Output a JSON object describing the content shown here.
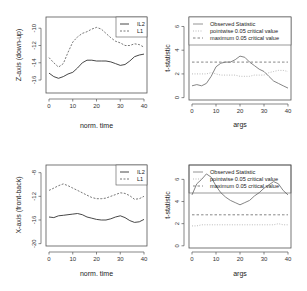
{
  "chart_data": [
    {
      "type": "line",
      "panel": "top-left",
      "xlabel": "norm. time",
      "ylabel": "Z-axis (down-up)",
      "xlim": [
        0,
        40
      ],
      "ylim": [
        -17.5,
        -8.7
      ],
      "xticks": [
        0,
        10,
        20,
        30,
        40
      ],
      "yticks": [
        -16,
        -14,
        -12,
        -10
      ],
      "legend": {
        "position": "topright",
        "entries": [
          "IL2",
          "L1"
        ]
      },
      "x": [
        0,
        2,
        4,
        6,
        8,
        10,
        12,
        14,
        16,
        18,
        20,
        22,
        24,
        26,
        28,
        30,
        32,
        34,
        36,
        38,
        40
      ],
      "series": [
        {
          "name": "IL2",
          "style": "solid",
          "values": [
            -15.2,
            -15.6,
            -15.8,
            -15.6,
            -15.3,
            -15.1,
            -14.6,
            -14.0,
            -13.7,
            -13.7,
            -13.8,
            -13.8,
            -13.8,
            -13.9,
            -14.1,
            -14.3,
            -14.2,
            -13.8,
            -13.3,
            -13.1,
            -13.0
          ]
        },
        {
          "name": "L1",
          "style": "dashed",
          "values": [
            -13.4,
            -14.0,
            -14.5,
            -14.1,
            -12.8,
            -11.6,
            -11.0,
            -10.6,
            -10.4,
            -10.1,
            -9.9,
            -10.1,
            -10.6,
            -11.1,
            -11.5,
            -11.7,
            -12.0,
            -12.0,
            -11.8,
            -11.9,
            -12.2
          ]
        }
      ],
      "grid": false
    },
    {
      "type": "line",
      "panel": "top-right",
      "xlabel": "args",
      "ylabel": "t-statistic",
      "xlim": [
        0,
        40
      ],
      "ylim": [
        -0.2,
        6.8
      ],
      "xticks": [
        0,
        10,
        20,
        30,
        40
      ],
      "yticks": [
        0,
        2,
        4,
        6
      ],
      "legend": {
        "position": "top",
        "entries": [
          "Observed Statistic",
          "pointwise 0.05 critical value",
          "maximum 0.05 critical value"
        ]
      },
      "x": [
        0,
        2,
        4,
        6,
        8,
        10,
        12,
        14,
        16,
        18,
        20,
        22,
        24,
        26,
        28,
        30,
        32,
        34,
        36,
        38,
        40
      ],
      "series": [
        {
          "name": "Observed Statistic",
          "style": "solid",
          "values": [
            1.0,
            1.1,
            1.0,
            1.2,
            1.8,
            2.6,
            2.9,
            3.0,
            3.0,
            3.2,
            3.5,
            3.4,
            3.0,
            2.7,
            2.4,
            2.2,
            1.8,
            1.4,
            1.2,
            1.0,
            0.8
          ]
        },
        {
          "name": "pointwise 0.05 critical value",
          "style": "dotted",
          "values": [
            2.0,
            2.0,
            2.0,
            2.0,
            2.1,
            2.0,
            1.9,
            1.9,
            1.9,
            1.9,
            1.8,
            1.8,
            1.8,
            1.9,
            1.9,
            1.9,
            2.1,
            2.2,
            2.3,
            2.3,
            2.2
          ]
        },
        {
          "name": "maximum 0.05 critical value",
          "style": "dashed",
          "values": [
            3.0,
            3.0,
            3.0,
            3.0,
            3.0,
            3.0,
            3.0,
            3.0,
            3.0,
            3.0,
            3.0,
            3.0,
            3.0,
            3.0,
            3.0,
            3.0,
            3.0,
            3.0,
            3.0,
            3.0,
            3.0
          ]
        }
      ],
      "grid": false
    },
    {
      "type": "line",
      "panel": "bottom-left",
      "xlabel": "norm. time",
      "ylabel": "X-axis (front-back)",
      "xlim": [
        0,
        40
      ],
      "ylim": [
        -20.4,
        -6.7
      ],
      "xticks": [
        0,
        10,
        20,
        30,
        40
      ],
      "yticks": [
        -20,
        -16,
        -12,
        -8
      ],
      "legend": {
        "position": "topright",
        "entries": [
          "IL2",
          "L1"
        ]
      },
      "x": [
        0,
        2,
        4,
        6,
        8,
        10,
        12,
        14,
        16,
        18,
        20,
        22,
        24,
        26,
        28,
        30,
        32,
        34,
        36,
        38,
        40
      ],
      "series": [
        {
          "name": "IL2",
          "style": "solid",
          "values": [
            -15.5,
            -15.6,
            -15.3,
            -15.2,
            -15.1,
            -15.0,
            -14.9,
            -15.1,
            -15.5,
            -15.7,
            -15.9,
            -16.0,
            -16.0,
            -15.8,
            -15.5,
            -15.3,
            -15.6,
            -16.1,
            -16.4,
            -16.3,
            -15.9
          ]
        },
        {
          "name": "L1",
          "style": "dashed",
          "values": [
            -11.0,
            -10.6,
            -10.2,
            -9.9,
            -10.2,
            -10.6,
            -11.0,
            -11.4,
            -11.8,
            -12.2,
            -12.4,
            -12.4,
            -12.3,
            -12.0,
            -11.7,
            -11.4,
            -11.5,
            -11.9,
            -12.5,
            -12.4,
            -12.0
          ]
        }
      ],
      "grid": false
    },
    {
      "type": "line",
      "panel": "bottom-right",
      "xlabel": "args",
      "ylabel": "t-statistic",
      "xlim": [
        0,
        40
      ],
      "ylim": [
        -0.2,
        7.3
      ],
      "xticks": [
        0,
        10,
        20,
        30,
        40
      ],
      "yticks": [
        0,
        2,
        4,
        6
      ],
      "legend": {
        "position": "top",
        "entries": [
          "Observed Statistic",
          "pointwise 0.05 critical value",
          "maximum 0.05 critical value"
        ]
      },
      "x": [
        0,
        2,
        4,
        6,
        8,
        10,
        12,
        14,
        16,
        18,
        20,
        22,
        24,
        26,
        28,
        30,
        32,
        34,
        36,
        38,
        40
      ],
      "series": [
        {
          "name": "Observed Statistic",
          "style": "solid",
          "values": [
            4.6,
            5.6,
            6.0,
            6.5,
            6.2,
            5.4,
            4.8,
            4.4,
            4.1,
            3.9,
            3.7,
            3.9,
            4.1,
            4.5,
            4.8,
            5.2,
            5.5,
            5.8,
            5.6,
            5.0,
            4.6
          ]
        },
        {
          "name": "pointwise 0.05 critical value",
          "style": "dotted",
          "values": [
            1.8,
            1.8,
            1.9,
            1.9,
            1.9,
            1.9,
            1.9,
            1.9,
            1.9,
            1.9,
            1.9,
            1.9,
            1.9,
            1.9,
            1.9,
            1.9,
            1.9,
            1.9,
            2.0,
            1.9,
            1.9
          ]
        },
        {
          "name": "maximum 0.05 critical value",
          "style": "dashed",
          "values": [
            2.8,
            2.8,
            2.8,
            2.8,
            2.8,
            2.8,
            2.8,
            2.8,
            2.8,
            2.8,
            2.8,
            2.8,
            2.8,
            2.8,
            2.8,
            2.8,
            2.8,
            2.8,
            2.8,
            2.8,
            2.8
          ]
        }
      ],
      "grid": false
    }
  ],
  "panels": [
    {
      "xlabel": "norm. time",
      "ylabel": "Z-axis (down-up)",
      "legend": [
        "IL2",
        "L1"
      ],
      "xticks": [
        "0",
        "10",
        "20",
        "30",
        "40"
      ],
      "yticks": [
        "-16",
        "-14",
        "-12",
        "-10"
      ]
    },
    {
      "xlabel": "args",
      "ylabel": "t-statistic",
      "legend": [
        "Observed Statistic",
        "pointwise 0.05 critical value",
        "maximum 0.05 critical value"
      ],
      "xticks": [
        "0",
        "10",
        "20",
        "30",
        "40"
      ],
      "yticks": [
        "0",
        "2",
        "4",
        "6"
      ]
    },
    {
      "xlabel": "norm. time",
      "ylabel": "X-axis (front-back)",
      "legend": [
        "IL2",
        "L1"
      ],
      "xticks": [
        "0",
        "10",
        "20",
        "30",
        "40"
      ],
      "yticks": [
        "-20",
        "-16",
        "-12",
        "-8"
      ]
    },
    {
      "xlabel": "args",
      "ylabel": "t-statistic",
      "legend": [
        "Observed Statistic",
        "pointwise 0.05 critical value",
        "maximum 0.05 critical value"
      ],
      "xticks": [
        "0",
        "10",
        "20",
        "30",
        "40"
      ],
      "yticks": [
        "0",
        "2",
        "4",
        "6"
      ]
    }
  ],
  "colors": {
    "line": "#333333",
    "axis": "#555555",
    "text": "#222222",
    "background": "#ffffff"
  }
}
